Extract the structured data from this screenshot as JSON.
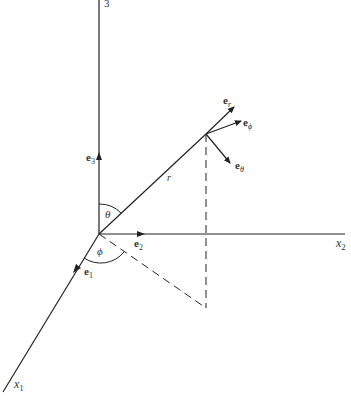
{
  "diagram": {
    "colors": {
      "line": "#222222",
      "text": "#333333",
      "background": "#ffffff"
    },
    "axes": {
      "x1": {
        "label": "x",
        "sub": "1"
      },
      "x2": {
        "label": "x",
        "sub": "2"
      },
      "x3": {
        "label": "3"
      }
    },
    "basis_vectors": {
      "e1": {
        "label": "e",
        "sub": "1"
      },
      "e2": {
        "label": "e",
        "sub": "2"
      },
      "e3": {
        "label": "e",
        "sub": "3"
      }
    },
    "spherical_vectors": {
      "er": {
        "label": "e",
        "sub": "r"
      },
      "ephi": {
        "label": "e",
        "sub": "ϕ"
      },
      "etheta": {
        "label": "e",
        "sub": "θ"
      }
    },
    "angles": {
      "theta": "θ",
      "phi": "ϕ"
    },
    "radius_label": "r"
  }
}
